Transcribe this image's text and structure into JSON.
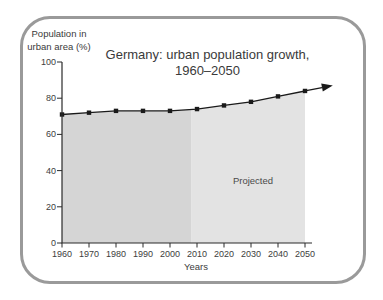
{
  "chart_data": {
    "type": "area",
    "title_lines": [
      "Germany: urban population growth,",
      "1960–2050"
    ],
    "ylabel_lines": [
      "Population in",
      "urban area (%)"
    ],
    "xlabel": "Years",
    "x": [
      1960,
      1970,
      1980,
      1990,
      2000,
      2010,
      2020,
      2030,
      2040,
      2050
    ],
    "values": [
      71,
      72,
      73,
      73,
      73,
      74,
      76,
      78,
      81,
      84
    ],
    "yticks": [
      0,
      20,
      40,
      60,
      80,
      100
    ],
    "ylim": [
      0,
      100
    ],
    "xlim": [
      1960,
      2050
    ],
    "grid": false,
    "legend": "none",
    "projection_start_year": 2008,
    "annotation": "Projected",
    "marker": "square",
    "arrow_beyond_last_point": true,
    "colors": {
      "historical_fill": "#d5d5d5",
      "projected_fill": "#e3e3e3",
      "line": "#1a1a1a",
      "axis": "#2b2b2b",
      "text": "#3a3a3a",
      "frame_border": "#9a9a9a",
      "background": "#ffffff"
    }
  }
}
